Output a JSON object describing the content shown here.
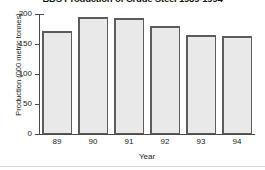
{
  "chart_data": {
    "type": "bar",
    "title": "BDS Production of Crude Steel 1989-1994",
    "xlabel": "Year",
    "ylabel": "Production (000 metric tonnes)",
    "categories": [
      "89",
      "90",
      "91",
      "92",
      "93",
      "94"
    ],
    "values": [
      172,
      195,
      193,
      180,
      165,
      164
    ],
    "ylim": [
      0,
      200
    ],
    "yticks": [
      0,
      50,
      100,
      150,
      200
    ],
    "ytick_labels": [
      "0",
      "50",
      "100",
      "150",
      "200"
    ],
    "grid": false,
    "legend": null,
    "series": [
      {
        "name": "Crude Steel Production",
        "values": [
          172,
          195,
          193,
          180,
          165,
          164
        ]
      }
    ],
    "colors": {
      "bar_fill": "#e9e9e9",
      "bar_edge": "#5c5c5c",
      "axis": "#4a4a4a",
      "text": "#1a1a1a",
      "background": "#ffffff"
    }
  }
}
